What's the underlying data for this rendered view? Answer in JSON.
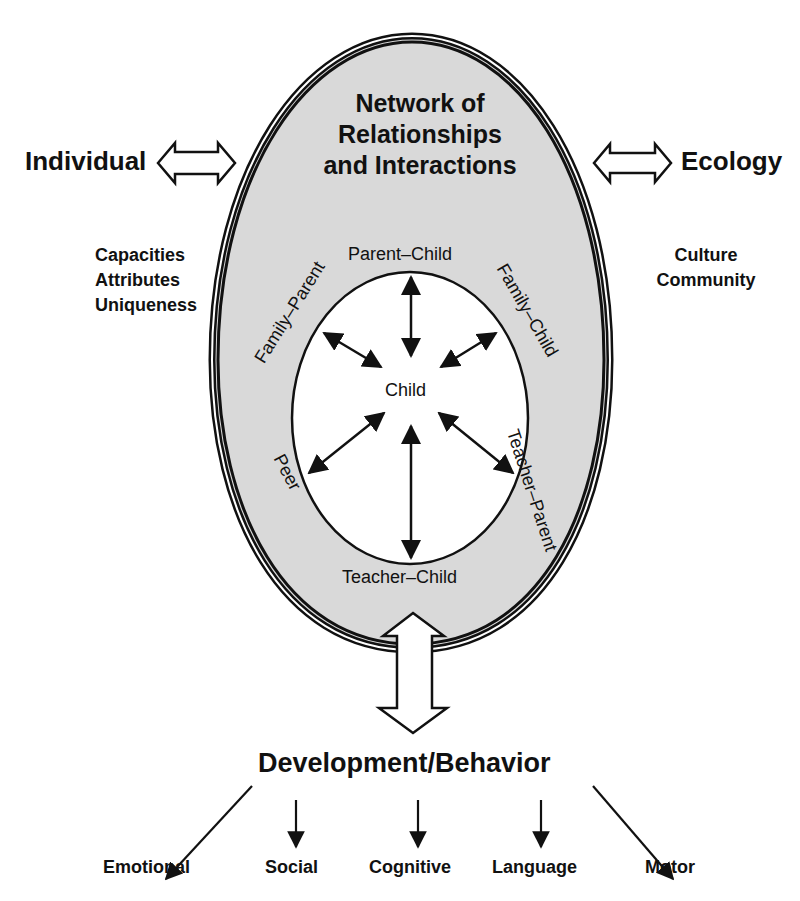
{
  "diagram": {
    "center_title": [
      "Network of",
      "Relationships",
      "and Interactions"
    ],
    "center_node": "Child",
    "relationships": {
      "top": "Parent–Child",
      "upper_left": "Family–Parent",
      "upper_right": "Family–Child",
      "lower_left": "Peer",
      "lower_right": "Teacher–Parent",
      "bottom": "Teacher–Child"
    },
    "left": {
      "label": "Individual",
      "items": [
        "Capacities",
        "Attributes",
        "Uniqueness"
      ]
    },
    "right": {
      "label": "Ecology",
      "items": [
        "Culture",
        "Community"
      ]
    },
    "outcome": {
      "label": "Development/Behavior",
      "domains": [
        "Emotional",
        "Social",
        "Cognitive",
        "Language",
        "Motor"
      ]
    },
    "colors": {
      "egg_fill": "#d9d9d9",
      "line": "#111111",
      "background": "#ffffff"
    }
  }
}
